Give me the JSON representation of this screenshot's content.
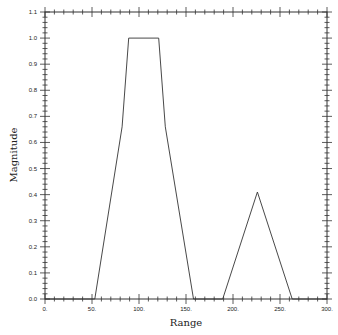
{
  "chart_data": {
    "type": "line",
    "title": "",
    "xlabel": "Range",
    "ylabel": "Magnitude",
    "xlim": [
      0,
      300
    ],
    "ylim": [
      0,
      1.1
    ],
    "x_major_ticks": [
      0,
      50,
      100,
      150,
      200,
      250,
      300
    ],
    "x_tick_labels": [
      "0.",
      "50.",
      "100.",
      "150.",
      "200.",
      "250.",
      "300."
    ],
    "x_minor_step": 10,
    "y_major_ticks": [
      0.0,
      0.1,
      0.2,
      0.3,
      0.4,
      0.5,
      0.6,
      0.7,
      0.8,
      0.9,
      1.0,
      1.1
    ],
    "y_tick_labels": [
      "0.0",
      "0.1",
      "0.2",
      "0.3",
      "0.4",
      "0.5",
      "0.6",
      "0.7",
      "0.8",
      "0.9",
      "1.0",
      "1.1"
    ],
    "y_minor_step": 0.02,
    "grid": false,
    "legend": "none",
    "series": [
      {
        "name": "magnitude",
        "color": "#333333",
        "x": [
          0,
          53,
          82,
          89,
          121,
          128,
          158,
          189,
          226,
          263,
          300
        ],
        "y": [
          0,
          0,
          0.66,
          1.0,
          1.0,
          0.66,
          0,
          0,
          0.41,
          0,
          0
        ]
      }
    ]
  }
}
